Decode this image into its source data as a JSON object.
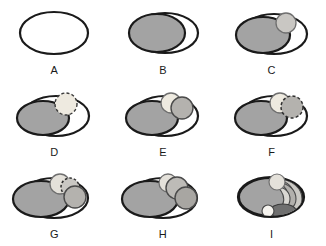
{
  "figure": {
    "background_color": "#ffffff",
    "rows": 3,
    "columns": 3
  },
  "palette": {
    "outline": "#1a1a1a",
    "white": "#ffffff",
    "pale": "#eeeae0",
    "light_gray": "#d8d6d2",
    "mid_gray": "#b4b2ae",
    "gray": "#a3a3a3",
    "dark_gray": "#6f6f6f"
  },
  "panels": [
    {
      "id": "A",
      "label": "A",
      "description": "empty ellipse outline",
      "outer_ellipse": {
        "cx": 52,
        "cy": 28,
        "rx": 34,
        "ry": 21,
        "fill": "#ffffff",
        "stroke": "#1a1a1a",
        "stroke_width": 2
      },
      "shapes": []
    },
    {
      "id": "B",
      "label": "B",
      "description": "one large gray primordial mass filling left portion",
      "outer_ellipse": {
        "cx": 52,
        "cy": 28,
        "rx": 34,
        "ry": 21,
        "fill": "#ffffff",
        "stroke": "#1a1a1a",
        "stroke_width": 2
      },
      "shapes": [
        {
          "name": "large-gray-ellipse",
          "type": "ellipse",
          "cx": 46,
          "cy": 28,
          "rx": 29,
          "ry": 19,
          "fill": "#a3a3a3",
          "stroke": "#1a1a1a",
          "stroke_width": 2,
          "dashed": false
        }
      ]
    },
    {
      "id": "C",
      "label": "C",
      "description": "large gray mass plus one small light follicle upper right",
      "outer_ellipse": {
        "cx": 52,
        "cy": 28,
        "rx": 34,
        "ry": 21,
        "fill": "#ffffff",
        "stroke": "#1a1a1a",
        "stroke_width": 2
      },
      "shapes": [
        {
          "name": "large-gray-ellipse",
          "type": "ellipse",
          "cx": 43,
          "cy": 29,
          "rx": 27,
          "ry": 18,
          "fill": "#a3a3a3",
          "stroke": "#1a1a1a",
          "stroke_width": 2,
          "dashed": false
        },
        {
          "name": "small-follicle",
          "type": "circle",
          "cx": 66,
          "cy": 17,
          "rx": 10,
          "ry": 10,
          "fill": "#c9c7c3",
          "stroke": "#6f6f6f",
          "stroke_width": 1.2,
          "dashed": false
        }
      ]
    },
    {
      "id": "D",
      "label": "D",
      "description": "large gray mass plus one pale dashed-outline follicle",
      "outer_ellipse": {
        "cx": 52,
        "cy": 28,
        "rx": 34,
        "ry": 21,
        "fill": "#ffffff",
        "stroke": "#1a1a1a",
        "stroke_width": 2
      },
      "shapes": [
        {
          "name": "large-gray-ellipse",
          "type": "ellipse",
          "cx": 41,
          "cy": 30,
          "rx": 26,
          "ry": 17,
          "fill": "#a3a3a3",
          "stroke": "#1a1a1a",
          "stroke_width": 2,
          "dashed": false
        },
        {
          "name": "dashed-pale-follicle",
          "type": "circle",
          "cx": 64,
          "cy": 17,
          "rx": 11,
          "ry": 11,
          "fill": "#eeeae0",
          "stroke": "#3a3a3a",
          "stroke_width": 1.3,
          "dashed": true
        }
      ]
    },
    {
      "id": "E",
      "label": "E",
      "description": "large gray mass plus pale follicle and a gray follicle to its right",
      "outer_ellipse": {
        "cx": 52,
        "cy": 28,
        "rx": 34,
        "ry": 21,
        "fill": "#ffffff",
        "stroke": "#1a1a1a",
        "stroke_width": 2
      },
      "shapes": [
        {
          "name": "large-gray-ellipse",
          "type": "ellipse",
          "cx": 41,
          "cy": 30,
          "rx": 26,
          "ry": 17,
          "fill": "#a3a3a3",
          "stroke": "#1a1a1a",
          "stroke_width": 2,
          "dashed": false
        },
        {
          "name": "pale-follicle",
          "type": "circle",
          "cx": 60,
          "cy": 16,
          "rx": 10,
          "ry": 10,
          "fill": "#eeeae0",
          "stroke": "#6f6f6f",
          "stroke_width": 1.2,
          "dashed": false
        },
        {
          "name": "gray-follicle",
          "type": "circle",
          "cx": 71,
          "cy": 21,
          "rx": 11,
          "ry": 11,
          "fill": "#b4b2ae",
          "stroke": "#4a4a4a",
          "stroke_width": 1.3,
          "dashed": false
        }
      ]
    },
    {
      "id": "F",
      "label": "F",
      "description": "large gray mass plus pale follicle and a dashed gray follicle right",
      "outer_ellipse": {
        "cx": 52,
        "cy": 28,
        "rx": 34,
        "ry": 21,
        "fill": "#ffffff",
        "stroke": "#1a1a1a",
        "stroke_width": 2
      },
      "shapes": [
        {
          "name": "large-gray-ellipse",
          "type": "ellipse",
          "cx": 41,
          "cy": 30,
          "rx": 26,
          "ry": 17,
          "fill": "#a3a3a3",
          "stroke": "#1a1a1a",
          "stroke_width": 2,
          "dashed": false
        },
        {
          "name": "pale-follicle",
          "type": "circle",
          "cx": 60,
          "cy": 16,
          "rx": 10,
          "ry": 10,
          "fill": "#eeeae0",
          "stroke": "#6f6f6f",
          "stroke_width": 1.2,
          "dashed": false
        },
        {
          "name": "dashed-gray-follicle",
          "type": "circle",
          "cx": 72,
          "cy": 20,
          "rx": 11,
          "ry": 11,
          "fill": "#b4b2ae",
          "stroke": "#2f2f2f",
          "stroke_width": 1.4,
          "dashed": true
        }
      ]
    },
    {
      "id": "G",
      "label": "G",
      "description": "large gray mass, pale follicle, dashed follicle behind, gray follicle lower right",
      "outer_ellipse": {
        "cx": 52,
        "cy": 28,
        "rx": 34,
        "ry": 21,
        "fill": "#ffffff",
        "stroke": "#1a1a1a",
        "stroke_width": 2
      },
      "shapes": [
        {
          "name": "large-gray-ellipse",
          "type": "ellipse",
          "cx": 39,
          "cy": 29,
          "rx": 27,
          "ry": 18,
          "fill": "#a3a3a3",
          "stroke": "#1a1a1a",
          "stroke_width": 2,
          "dashed": false
        },
        {
          "name": "pale-follicle",
          "type": "circle",
          "cx": 58,
          "cy": 15,
          "rx": 10,
          "ry": 10,
          "fill": "#e4e1da",
          "stroke": "#6f6f6f",
          "stroke_width": 1.2,
          "dashed": false
        },
        {
          "name": "dashed-follicle",
          "type": "circle",
          "cx": 68,
          "cy": 18,
          "rx": 9,
          "ry": 9,
          "fill": "#c9c7c3",
          "stroke": "#2f2f2f",
          "stroke_width": 1.4,
          "dashed": true
        },
        {
          "name": "gray-follicle",
          "type": "circle",
          "cx": 73,
          "cy": 27,
          "rx": 11,
          "ry": 11,
          "fill": "#b4b2ae",
          "stroke": "#4a4a4a",
          "stroke_width": 1.3,
          "dashed": false
        }
      ]
    },
    {
      "id": "H",
      "label": "H",
      "description": "large gray mass with three stacked follicles descending to the right",
      "outer_ellipse": {
        "cx": 52,
        "cy": 28,
        "rx": 34,
        "ry": 21,
        "fill": "#ffffff",
        "stroke": "#1a1a1a",
        "stroke_width": 2
      },
      "shapes": [
        {
          "name": "large-gray-ellipse",
          "type": "ellipse",
          "cx": 39,
          "cy": 29,
          "rx": 27,
          "ry": 18,
          "fill": "#a3a3a3",
          "stroke": "#1a1a1a",
          "stroke_width": 2,
          "dashed": false
        },
        {
          "name": "pale-follicle",
          "type": "circle",
          "cx": 57,
          "cy": 14,
          "rx": 9,
          "ry": 9,
          "fill": "#e4e1da",
          "stroke": "#6f6f6f",
          "stroke_width": 1.2,
          "dashed": false
        },
        {
          "name": "mid-follicle",
          "type": "circle",
          "cx": 66,
          "cy": 19,
          "rx": 11,
          "ry": 11,
          "fill": "#bdbbb7",
          "stroke": "#4a4a4a",
          "stroke_width": 1.3,
          "dashed": false
        },
        {
          "name": "gray-follicle",
          "type": "circle",
          "cx": 75,
          "cy": 28,
          "rx": 11,
          "ry": 11,
          "fill": "#a8a6a2",
          "stroke": "#4a4a4a",
          "stroke_width": 1.3,
          "dashed": false
        }
      ]
    },
    {
      "id": "I",
      "label": "I",
      "description": "corpus luteum stage: nested crescent bands with small white circle and dark body at bottom",
      "outer_ellipse": {
        "cx": 52,
        "cy": 28,
        "rx": 34,
        "ry": 21,
        "fill": "#ffffff",
        "stroke": "#1a1a1a",
        "stroke_width": 2
      },
      "shapes": [
        {
          "name": "large-gray-ellipse",
          "type": "ellipse",
          "cx": 46,
          "cy": 28,
          "rx": 32,
          "ry": 19,
          "fill": "#a3a3a3",
          "stroke": "#1a1a1a",
          "stroke_width": 2,
          "dashed": false
        },
        {
          "name": "crescent-band-outer",
          "type": "crescent",
          "fill": "#cbc9c4",
          "stroke": "#4a4a4a"
        },
        {
          "name": "crescent-band-middle",
          "type": "crescent",
          "fill": "#b2b0ac",
          "stroke": "#4a4a4a"
        },
        {
          "name": "crescent-band-inner",
          "type": "crescent",
          "fill": "#d9d7d2",
          "stroke": "#4a4a4a"
        },
        {
          "name": "pale-follicle",
          "type": "circle",
          "cx": 57,
          "cy": 13,
          "rx": 8,
          "ry": 8,
          "fill": "#e4e1da",
          "stroke": "#6f6f6f",
          "stroke_width": 1.2,
          "dashed": false
        },
        {
          "name": "white-corpus-albicans",
          "type": "circle",
          "cx": 48,
          "cy": 42,
          "rx": 6,
          "ry": 6,
          "fill": "#f5f3ee",
          "stroke": "#4a4a4a",
          "stroke_width": 1.2,
          "dashed": false
        },
        {
          "name": "dark-corpus-luteum",
          "type": "ellipse",
          "cx": 63,
          "cy": 42,
          "rx": 13,
          "ry": 7,
          "fill": "#6f6f6f",
          "stroke": "#3a3a3a",
          "stroke_width": 1.2,
          "dashed": false
        }
      ]
    }
  ]
}
